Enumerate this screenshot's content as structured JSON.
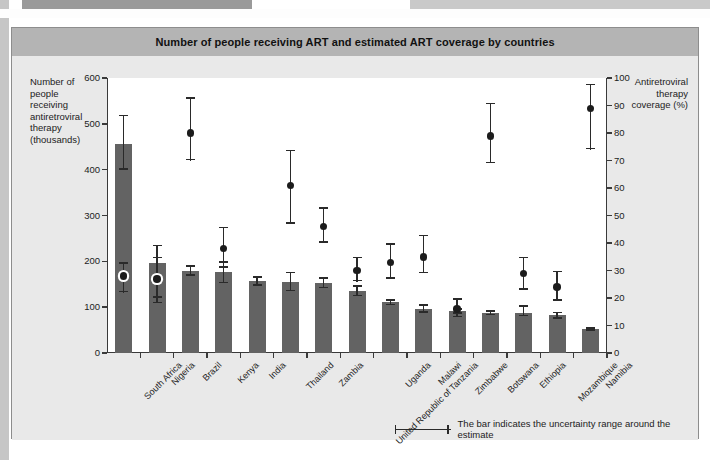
{
  "figure": {
    "title": "Number of people receiving ART and estimated ART coverage by countries",
    "left_axis_title": "Number of people receiving antiretroviral therapy (thousands)",
    "right_axis_title": "Antiretroviral therapy coverage (%)",
    "footnote": "The bar indicates the uncertainty range around the estimate"
  },
  "legend": {
    "items": [
      {
        "label": "Number of people on treatment",
        "marker": "bar-swatch",
        "color": "#636363"
      },
      {
        "label": "Antiretroviral therapy coverage (%)",
        "marker": "dot-swatch",
        "color": "#1c1c1c"
      }
    ]
  },
  "colors": {
    "bar": "#636363",
    "dot": "#1c1c1c",
    "error": "#2a2a2a",
    "title_bar": "#b4b4b4",
    "figure_background": "#e9e9e9",
    "plot_background": "#ffffff",
    "axis": "#3a3a3a"
  },
  "chart_data": {
    "type": "bar",
    "title": "Number of people receiving ART and estimated ART coverage by countries",
    "xlabel": "",
    "ylabel": "Number of people receiving antiretroviral therapy (thousands)",
    "y2label": "Antiretroviral therapy coverage (%)",
    "ylim": [
      0,
      600
    ],
    "y2lim": [
      0,
      100
    ],
    "yticks": [
      0,
      100,
      200,
      300,
      400,
      500,
      600
    ],
    "y2ticks": [
      0,
      10,
      20,
      30,
      40,
      50,
      60,
      70,
      80,
      90,
      100
    ],
    "grid": false,
    "legend_position": "top-center",
    "categories": [
      "South Africa",
      "Nigeria",
      "Brazil",
      "Kenya",
      "India",
      "Thailand",
      "Zambia",
      "United Republic of Tanzania",
      "Uganda",
      "Malawi",
      "Zimbabwe",
      "Botswana",
      "Ethiopia",
      "Mozambique",
      "Namibia"
    ],
    "series": [
      {
        "name": "Number of people on treatment",
        "unit": "thousands",
        "type": "bar",
        "axis": "left",
        "values": [
          455,
          196,
          180,
          176,
          157,
          156,
          153,
          136,
          111,
          97,
          92,
          88,
          88,
          82,
          52
        ],
        "error_low": [
          400,
          108,
          168,
          152,
          147,
          135,
          141,
          124,
          104,
          88,
          86,
          82,
          80,
          74,
          48
        ],
        "error_high": [
          520,
          236,
          192,
          200,
          167,
          177,
          165,
          148,
          118,
          106,
          98,
          94,
          104,
          90,
          56
        ]
      },
      {
        "name": "Antiretroviral therapy coverage (%)",
        "unit": "%",
        "type": "scatter",
        "axis": "right",
        "values": [
          28,
          27,
          80,
          38,
          null,
          61,
          46,
          30,
          33,
          35,
          16,
          79,
          29,
          24,
          89
        ],
        "error_low": [
          22,
          20,
          70,
          31,
          null,
          47,
          40,
          26,
          27,
          29,
          13,
          69,
          23,
          19,
          74
        ],
        "error_high": [
          33,
          35,
          93,
          46,
          null,
          74,
          53,
          35,
          40,
          43,
          20,
          91,
          35,
          30,
          98
        ]
      }
    ]
  }
}
